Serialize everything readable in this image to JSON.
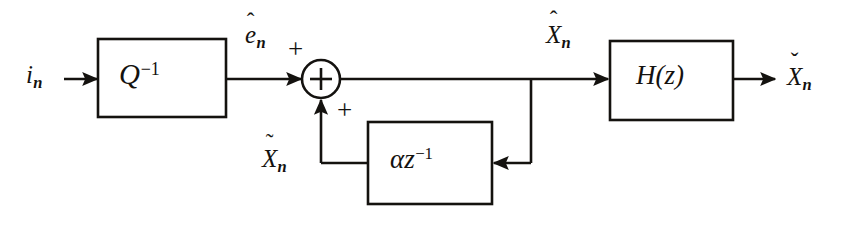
{
  "diagram": {
    "type": "signal-flow-block-diagram",
    "background_color": "#ffffff",
    "line_color": "#14120f",
    "blocks": [
      {
        "id": "inverse-quantizer",
        "label_base": "Q",
        "label_sup": "−1",
        "x": 98,
        "y": 39,
        "width": 128,
        "height": 78
      },
      {
        "id": "delay",
        "label_base": "αz",
        "label_sup": "−1",
        "x": 368,
        "y": 122,
        "width": 124,
        "height": 82
      },
      {
        "id": "reconstruction-filter",
        "label_base": "H(z)",
        "label_sup": "",
        "x": 610,
        "y": 41,
        "width": 123,
        "height": 79
      }
    ],
    "adder": {
      "id": "summing-junction",
      "symbol": "+",
      "cx": 321,
      "cy": 79,
      "r": 19,
      "plus_top": "+",
      "plus_bottom": "+"
    },
    "signals": {
      "input": {
        "base": "i",
        "sub": "n",
        "accent": ""
      },
      "quantizer_output": {
        "base": "e",
        "sub": "n",
        "accent": "ˆ"
      },
      "adder_output": {
        "base": "X",
        "sub": "n",
        "accent": "ˆ"
      },
      "feedback": {
        "base": "X",
        "sub": "n",
        "accent": "˜"
      },
      "output": {
        "base": "X",
        "sub": "n",
        "accent": "ˇ"
      }
    }
  }
}
